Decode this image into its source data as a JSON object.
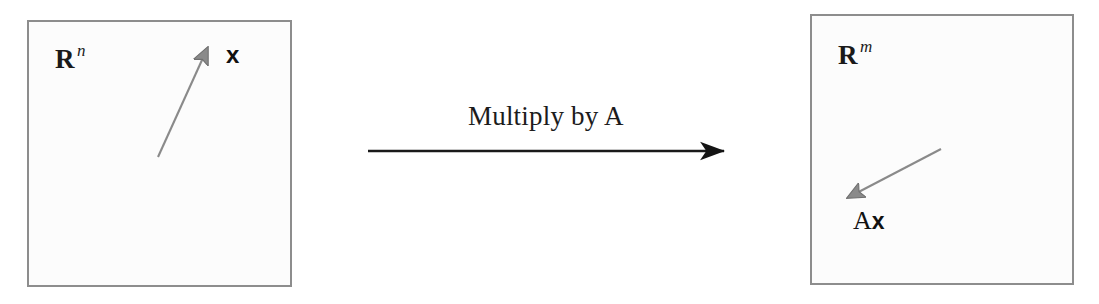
{
  "figure": {
    "type": "linear-transformation-diagram",
    "background_color": "#ffffff",
    "box_fill_color": "#fcfcfc",
    "box_border_color": "#8d8d8d",
    "vector_arrow_color": "#8a8a8a",
    "transform_arrow_color": "#1a1a1a",
    "text_color": "#1a1a1a"
  },
  "source_domain": {
    "set_symbol": "R",
    "set_exponent": "n",
    "vector_label": "x",
    "arrow": {
      "tail_x": 158,
      "tail_y": 157,
      "tip_x": 210,
      "tip_y": 42
    }
  },
  "transform": {
    "caption": "Multiply by A",
    "arrow": {
      "start_x": 368,
      "start_y": 151,
      "end_x": 733,
      "end_y": 151
    }
  },
  "target_domain": {
    "set_symbol": "R",
    "set_exponent": "m",
    "vector_label_prefix": "A",
    "vector_label_vector": "x",
    "arrow": {
      "tail_x": 941,
      "tail_y": 149,
      "tip_x": 840,
      "tip_y": 202
    }
  }
}
